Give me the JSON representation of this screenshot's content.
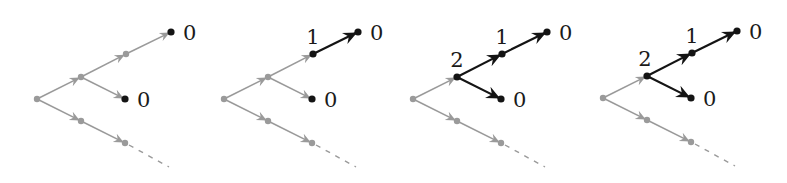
{
  "diagram": {
    "colors": {
      "inactive": "#9a9a9a",
      "active": "#141414",
      "background": "#ffffff"
    },
    "node_offsets": {
      "root": [
        0,
        0
      ],
      "A": [
        44,
        -22
      ],
      "B": [
        89,
        -45
      ],
      "T": [
        134,
        -67
      ],
      "M": [
        88,
        0
      ],
      "L1": [
        44,
        22
      ],
      "L2": [
        88,
        44
      ],
      "D": [
        132,
        68
      ]
    },
    "edges": [
      {
        "id": "root-A",
        "from": "root",
        "to": "A"
      },
      {
        "id": "A-B",
        "from": "A",
        "to": "B"
      },
      {
        "id": "B-T",
        "from": "B",
        "to": "T"
      },
      {
        "id": "A-M",
        "from": "A",
        "to": "M"
      },
      {
        "id": "root-L1",
        "from": "root",
        "to": "L1"
      },
      {
        "id": "L1-L2",
        "from": "L1",
        "to": "L2"
      }
    ],
    "panels": [
      {
        "id": "step-1",
        "origin": [
          37,
          99
        ],
        "active_edges": [],
        "active_nodes": [
          "T",
          "M"
        ],
        "labels": [
          {
            "node": "T",
            "text": "0",
            "dx": 12,
            "dy": 8
          },
          {
            "node": "M",
            "text": "0",
            "dx": 12,
            "dy": 8
          }
        ]
      },
      {
        "id": "step-2",
        "origin": [
          224,
          99
        ],
        "active_edges": [
          "B-T"
        ],
        "active_nodes": [
          "T",
          "M",
          "B"
        ],
        "labels": [
          {
            "node": "T",
            "text": "0",
            "dx": 12,
            "dy": 8
          },
          {
            "node": "M",
            "text": "0",
            "dx": 12,
            "dy": 8
          },
          {
            "node": "B",
            "text": "1",
            "dx": 0,
            "dy": -10
          }
        ]
      },
      {
        "id": "step-3",
        "origin": [
          413,
          99
        ],
        "active_edges": [
          "B-T",
          "A-B",
          "A-M"
        ],
        "active_nodes": [
          "T",
          "M",
          "B",
          "A"
        ],
        "labels": [
          {
            "node": "T",
            "text": "0",
            "dx": 12,
            "dy": 8
          },
          {
            "node": "M",
            "text": "0",
            "dx": 12,
            "dy": 8
          },
          {
            "node": "B",
            "text": "1",
            "dx": 0,
            "dy": -10
          },
          {
            "node": "A",
            "text": "2",
            "dx": 0,
            "dy": -10
          }
        ]
      },
      {
        "id": "step-4",
        "origin": [
          603,
          98
        ],
        "active_edges": [
          "B-T",
          "A-B",
          "A-M"
        ],
        "active_nodes": [
          "T",
          "M",
          "B",
          "A"
        ],
        "labels": [
          {
            "node": "T",
            "text": "0",
            "dx": 12,
            "dy": 8
          },
          {
            "node": "M",
            "text": "0",
            "dx": 12,
            "dy": 8
          },
          {
            "node": "B",
            "text": "1",
            "dx": 0,
            "dy": -10
          },
          {
            "node": "A",
            "text": "2",
            "dx": -2,
            "dy": -10
          }
        ]
      }
    ]
  }
}
